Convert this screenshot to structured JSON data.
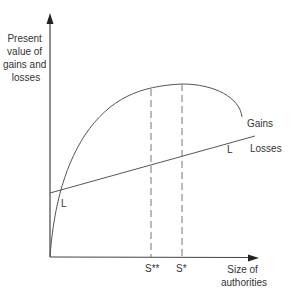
{
  "diagram": {
    "y_axis_label": [
      "Present",
      "value of",
      "gains and",
      "losses"
    ],
    "x_axis_label": [
      "Size of",
      "authorities"
    ],
    "curves": {
      "gains": {
        "label": "Gains"
      },
      "losses": {
        "label": "Losses"
      }
    },
    "intersection_labels": {
      "left": "L",
      "right": "L"
    },
    "markers": {
      "s_double_star": "S**",
      "s_star": "S*"
    },
    "colors": {
      "line": "#555555",
      "text": "#333333",
      "axis": "#444444"
    }
  }
}
